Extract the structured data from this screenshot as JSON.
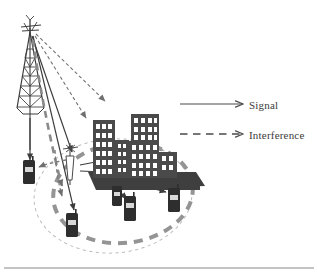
{
  "figure": {
    "type": "network-scenario-diagram",
    "title": "",
    "background_color": "#ffffff"
  },
  "legend": {
    "position": "right",
    "items": [
      {
        "key": "signal",
        "label": "Signal",
        "line_style": "solid",
        "arrow": "open-v",
        "color": "#4a4a4a"
      },
      {
        "key": "interference",
        "label": "Interference",
        "line_style": "dashed",
        "arrow": "open-v",
        "color": "#4a4a4a",
        "dash_count": 5
      }
    ]
  },
  "elements": {
    "tower": {
      "name": "macro-cell-tower",
      "description": "lattice mast with crossed antenna arms at top",
      "color": "#3c3c3c"
    },
    "small_antenna": {
      "name": "small-cell-antenna",
      "description": "slim base station antenna inside the cell",
      "color": "#555555"
    },
    "buildings": {
      "name": "building-cluster",
      "count": 4,
      "fill": "#4a4a4a",
      "window_fill": "#ffffff",
      "base_fill": "#3f3f3f"
    },
    "handsets": {
      "name": "mobile-handset",
      "count": 5,
      "body_fill": "#2e2e2e",
      "screen_fill": "#d8d8d8"
    },
    "coverage_outer": {
      "name": "outer-coverage-ellipse",
      "line_style": "fine-dashed",
      "color": "#b9b9b9",
      "stroke_width": 1
    },
    "coverage_inner": {
      "name": "inner-coverage-ellipse",
      "line_style": "bold-dashed",
      "color": "#8f8f8f",
      "stroke_width": 4
    }
  },
  "links": {
    "signal_color": "#3c3c3c",
    "interference_color": "#6a6a6a",
    "signal_count": 7,
    "interference_count": 6
  },
  "footer_rule": {
    "name": "bottom-rule",
    "color": "#7a7a7a"
  }
}
